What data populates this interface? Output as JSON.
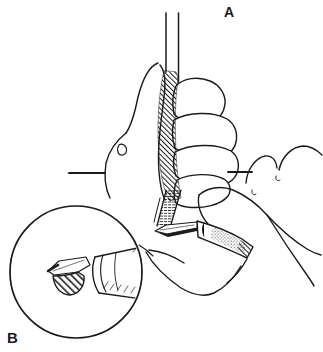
{
  "figure": {
    "background_color": "#ffffff",
    "ink_color": "#1a1a1a",
    "labels": {
      "main_view": "A",
      "inset_view": "B"
    },
    "descriptions": {
      "main_view": "Hand gripping a vertical tube while a second hand trims the tube base with a cone-handled blade",
      "inset_view": "Magnified detail of the blade tip"
    }
  }
}
